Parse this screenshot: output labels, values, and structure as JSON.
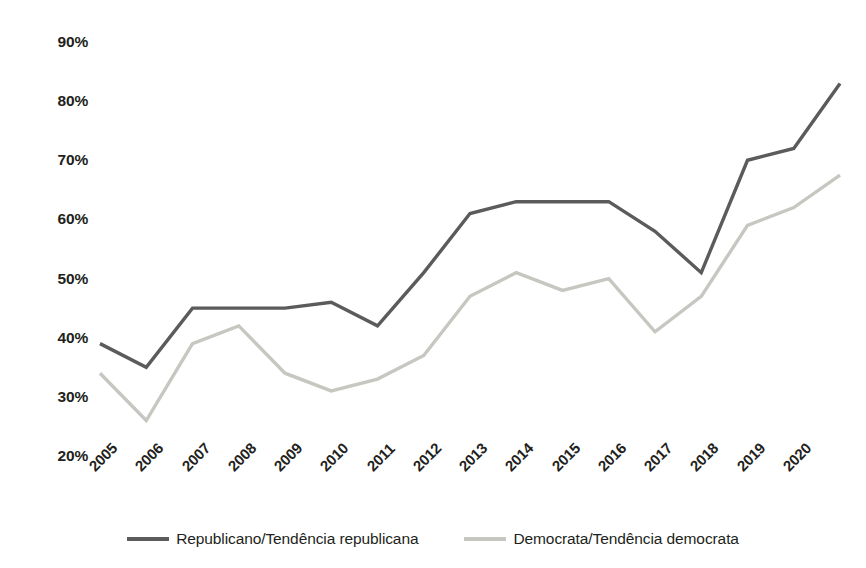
{
  "chart_data": {
    "type": "line",
    "title": "",
    "subtitle": "",
    "xlabel": "",
    "ylabel": "",
    "categories": [
      "2005",
      "2006",
      "2007",
      "2008",
      "2009",
      "2010",
      "2011",
      "2012",
      "2013",
      "2014",
      "2015",
      "2016",
      "2017",
      "2018",
      "2019",
      "2020",
      "2021"
    ],
    "tick_labels_shown": [
      "2005",
      "2006",
      "2007",
      "2008",
      "2009",
      "2010",
      "2011",
      "2012",
      "2013",
      "2014",
      "2015",
      "2016",
      "2017",
      "2018",
      "2019",
      "2020"
    ],
    "series": [
      {
        "name": "Republicano/Tendência republicana",
        "color": "#5a5b5a",
        "values": [
          39,
          35,
          45,
          45,
          45,
          46,
          42,
          51,
          61,
          63,
          63,
          63,
          58,
          51,
          70,
          72,
          83
        ]
      },
      {
        "name": "Democrata/Tendência democrata",
        "color": "#c6c7c0",
        "values": [
          34,
          26,
          39,
          42,
          34,
          31,
          33,
          37,
          47,
          51,
          48,
          50,
          41,
          47,
          59,
          62,
          67.5
        ]
      }
    ],
    "ylim": [
      20,
      90
    ],
    "ytick_values": [
      90,
      80,
      70,
      60,
      50,
      40,
      30,
      20
    ],
    "ytick_labels": [
      "90%",
      "80%",
      "70%",
      "60%",
      "50%",
      "40%",
      "30%",
      "20%"
    ],
    "grid": false,
    "legend_position": "bottom",
    "value_suffix": "%"
  },
  "legend": {
    "items": [
      {
        "label": "Republicano/Tendência republicana",
        "color": "#5a5b5a"
      },
      {
        "label": "Democrata/Tendência democrata",
        "color": "#c6c7c0"
      }
    ]
  }
}
